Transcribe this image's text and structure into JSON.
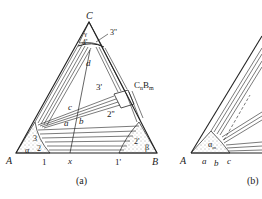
{
  "figure": {
    "panels": [
      {
        "id": "a",
        "caption": "(a)",
        "vertices": {
          "A": "A",
          "B": "B",
          "C": "C"
        },
        "phase_labels": {
          "alpha": "α",
          "beta": "β",
          "gamma": "γ"
        },
        "compound_label": "CnBm",
        "compound_label_main": "C",
        "compound_label_sub1": "n",
        "compound_label_mid": "B",
        "compound_label_sub2": "m",
        "point_labels": [
          "a",
          "b",
          "c",
          "d",
          "x"
        ],
        "region_labels": [
          "1",
          "1'",
          "2",
          "2'",
          "2''",
          "3",
          "3'",
          "3''",
          "4'"
        ]
      },
      {
        "id": "b",
        "caption": "(b)",
        "vertices": {
          "A": "A"
        },
        "phase_labels": {
          "alpha": "α"
        },
        "phase_label_sub": "m",
        "point_labels": [
          "a",
          "b",
          "c"
        ]
      }
    ]
  }
}
